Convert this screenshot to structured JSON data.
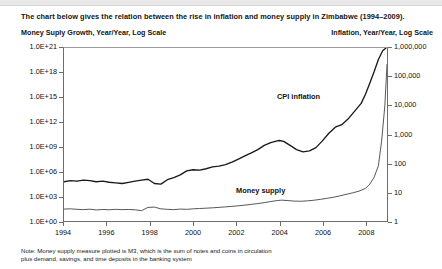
{
  "headline": "The chart below gives the relation between the rise in inflation and money supply in Zimbabwe (1994–2009).",
  "axis_captions": {
    "left": "Money Suply Growth, Year/Year, Log Scale",
    "right": "Inflation, Year/Year, Log Scale"
  },
  "footnote": {
    "line1": "Note: Money supply measure plotted is M3, which is the sum of notes and coins in circulation",
    "line2": "plus demand, savings, and time deposits in the banking system"
  },
  "chart_data": {
    "type": "line",
    "title": "The chart below gives the relation between the rise in inflation and money supply in Zimbabwe (1994–2009).",
    "xlabel": "",
    "ylabel": "Money Suply Growth, Year/Year, Log Scale",
    "ylabel_right": "Inflation, Year/Year, Log Scale",
    "grid": false,
    "legend": "inline-annotations",
    "xlim": [
      1994,
      2009
    ],
    "xticks": [
      1994,
      1996,
      1998,
      2000,
      2002,
      2004,
      2006,
      2008
    ],
    "xtick_labels": [
      "1994",
      "1996",
      "1998",
      "2000",
      "2002",
      "2004",
      "2006",
      "2008"
    ],
    "left_axis": {
      "scale": "log",
      "ylim": [
        1,
        1e+21
      ],
      "ticks": [
        1,
        1000,
        1000000,
        1000000000,
        1000000000000,
        1000000000000000,
        1e+18,
        1e+21
      ],
      "tick_labels": [
        "1.0E+00",
        "1.0E+03",
        "1.0E+06",
        "1.0E+09",
        "1.0E+12",
        "1.0E+15",
        "1.0E+18",
        "1.0E+21"
      ]
    },
    "right_axis": {
      "scale": "log",
      "ylim": [
        1,
        1000000
      ],
      "ticks": [
        1,
        10,
        100,
        1000,
        10000,
        100000,
        1000000
      ],
      "tick_labels": [
        "1",
        "10",
        "100",
        "1,000",
        "10,000",
        "100,000",
        "1,000,000"
      ]
    },
    "annotations": [
      {
        "text": "CPI inflation",
        "x": 2005.2,
        "y_axis": "right"
      },
      {
        "text": "Money supply",
        "x": 2003.4,
        "y_axis": "left"
      }
    ],
    "series": [
      {
        "name": "CPI inflation",
        "axis": "right",
        "color": "#1a1a1a",
        "units": "percent year/year",
        "x": [
          1994.0,
          1994.3,
          1994.6,
          1994.9,
          1995.2,
          1995.5,
          1995.8,
          1996.1,
          1996.4,
          1996.7,
          1997.0,
          1997.3,
          1997.6,
          1997.9,
          1998.2,
          1998.5,
          1998.8,
          1999.1,
          1999.4,
          1999.7,
          2000.0,
          2000.3,
          2000.6,
          2000.9,
          2001.2,
          2001.5,
          2001.8,
          2002.1,
          2002.4,
          2002.7,
          2003.0,
          2003.3,
          2003.6,
          2003.9,
          2004.0,
          2004.2,
          2004.5,
          2004.8,
          2005.1,
          2005.4,
          2005.7,
          2006.0,
          2006.3,
          2006.6,
          2006.9,
          2007.2,
          2007.5,
          2007.8,
          2008.0,
          2008.2,
          2008.4,
          2008.6,
          2008.8,
          2008.95
        ],
        "y": [
          23,
          25,
          24,
          26,
          25,
          23,
          24,
          22,
          21,
          20,
          22,
          24,
          26,
          28,
          20,
          19,
          27,
          32,
          40,
          55,
          60,
          58,
          65,
          75,
          80,
          90,
          110,
          140,
          180,
          230,
          300,
          420,
          520,
          600,
          620,
          580,
          420,
          300,
          250,
          270,
          350,
          600,
          1100,
          1800,
          2200,
          3500,
          6500,
          12000,
          25000,
          60000,
          150000,
          400000,
          800000,
          1000000
        ],
        "note": "Annual CPI inflation rate, Zimbabwe; peaks near 2004, dips, then hyperinflation explosion in 2008"
      },
      {
        "name": "Money supply",
        "axis": "left",
        "color": "#444444",
        "units": "M3 growth, index log scale",
        "x": [
          1994.0,
          1994.3,
          1994.6,
          1994.9,
          1995.2,
          1995.5,
          1995.8,
          1996.1,
          1996.4,
          1996.7,
          1997.0,
          1997.3,
          1997.6,
          1997.9,
          1998.2,
          1998.5,
          1998.8,
          1999.1,
          1999.4,
          1999.7,
          2000.0,
          2000.3,
          2000.6,
          2000.9,
          2001.2,
          2001.5,
          2001.8,
          2002.1,
          2002.4,
          2002.7,
          2003.0,
          2003.3,
          2003.6,
          2003.9,
          2004.1,
          2004.4,
          2004.7,
          2005.0,
          2005.3,
          2005.6,
          2005.9,
          2006.2,
          2006.5,
          2006.8,
          2007.1,
          2007.4,
          2007.7,
          2008.0,
          2008.2,
          2008.4,
          2008.6,
          2008.75,
          2008.9,
          2009.0
        ],
        "y": [
          28,
          30,
          26,
          24,
          27,
          22,
          25,
          23,
          26,
          24,
          25,
          23,
          18,
          45,
          48,
          30,
          26,
          24,
          28,
          26,
          30,
          33,
          36,
          40,
          45,
          52,
          60,
          70,
          85,
          105,
          130,
          170,
          230,
          300,
          340,
          300,
          260,
          250,
          280,
          330,
          420,
          560,
          750,
          1100,
          1700,
          2600,
          4200,
          9000,
          30000,
          200000,
          5000000,
          5000000000.0,
          100000000000000.0,
          1e+19
        ],
        "note": "M3 money supply growth; near-flat until 2004 bump, then hyperinflationary vertical rise in 2008-2009"
      }
    ]
  }
}
